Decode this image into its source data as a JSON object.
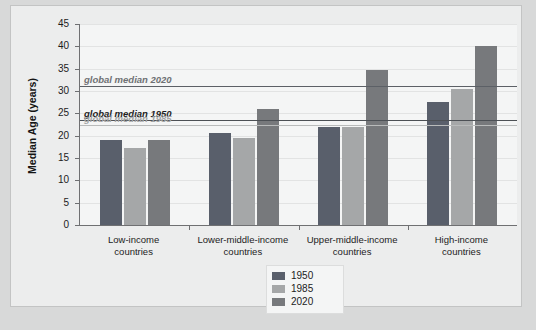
{
  "chart_data": {
    "type": "bar",
    "title": "",
    "subtitle": "",
    "xlabel": "",
    "ylabel": "Median Age (years)",
    "ylim": [
      0,
      45
    ],
    "yticks": [
      0,
      5,
      10,
      15,
      20,
      25,
      30,
      35,
      40,
      45
    ],
    "ytick_labels": [
      "0",
      "5",
      "10",
      "15",
      "20",
      "25",
      "30",
      "35",
      "40",
      "45"
    ],
    "grid": true,
    "legend_position": "bottom-center",
    "categories": [
      "Low-income countries",
      "Lower-middle-income countries",
      "Upper-middle-income countries",
      "High-income countries"
    ],
    "category_lines": [
      [
        "Low-income",
        "countries"
      ],
      [
        "Lower-middle-income",
        "countries"
      ],
      [
        "Upper-middle-income",
        "countries"
      ],
      [
        "High-income",
        "countries"
      ]
    ],
    "series": [
      {
        "name": "1950",
        "color": "#595f6b",
        "values": [
          19.0,
          20.5,
          22.0,
          27.5
        ]
      },
      {
        "name": "1985",
        "color": "#a5a7a8",
        "values": [
          17.2,
          19.4,
          22.0,
          30.5
        ]
      },
      {
        "name": "2020",
        "color": "#77797c",
        "values": [
          19.0,
          26.0,
          34.8,
          40.0
        ]
      }
    ],
    "reference_lines": [
      {
        "label": "global median 2020",
        "value": 31.2,
        "color": "#5c6066",
        "text_color": "#6f7174"
      },
      {
        "label": "global median 1950",
        "value": 23.5,
        "color": "#4c5055",
        "text_color": "#1f1f1f"
      },
      {
        "label": "global median 1985",
        "value": 22.4,
        "color": "#b9bbbb",
        "text_color": "#a3a5a6"
      }
    ]
  },
  "legend": {
    "items": [
      {
        "label": "1950",
        "color": "#595f6b"
      },
      {
        "label": "1985",
        "color": "#a5a7a8"
      },
      {
        "label": "2020",
        "color": "#77797c"
      }
    ]
  },
  "colors": {
    "page_background": "#d8d9d9",
    "card_background": "#eceded",
    "panel_background": "#f4f5f5",
    "axis": "#6f7072",
    "gridline": "#e2e3e3"
  }
}
